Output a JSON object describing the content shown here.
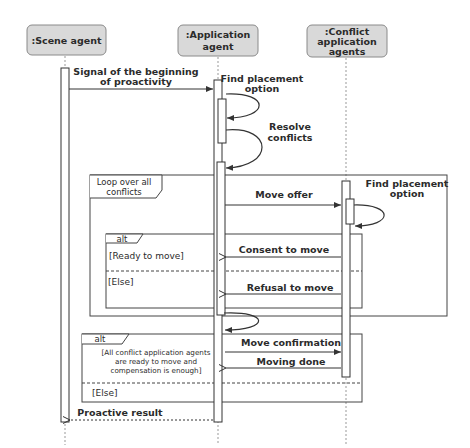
{
  "diagram": {
    "type": "UML sequence diagram",
    "colors": {
      "actor_fill": "#d9d9d9",
      "actor_stroke": "#8a8a8a",
      "line": "#333333",
      "lifeline": "#999999",
      "background": "#ffffff"
    },
    "lifelines": [
      {
        "id": "scene",
        "label": ":Scene agent"
      },
      {
        "id": "app",
        "label_lines": [
          ":Application",
          "agent"
        ]
      },
      {
        "id": "conflict",
        "label_lines": [
          ":Conflict",
          "application",
          "agents"
        ]
      }
    ],
    "messages": [
      {
        "from": "scene",
        "to": "app",
        "label_lines": [
          "Signal of the beginning",
          "of proactivity"
        ],
        "style": "sync"
      },
      {
        "from": "app",
        "to": "app",
        "label_lines": [
          "Find placement",
          "option"
        ],
        "style": "self"
      },
      {
        "from": "app",
        "to": "app",
        "label_lines": [
          "Resolve",
          "conflicts"
        ],
        "style": "self"
      },
      {
        "from": "app",
        "to": "conflict",
        "label": "Move offer",
        "style": "sync"
      },
      {
        "from": "conflict",
        "to": "conflict",
        "label_lines": [
          "Find placement",
          "option"
        ],
        "style": "self"
      },
      {
        "from": "conflict",
        "to": "app",
        "label": "Consent to move",
        "style": "reply"
      },
      {
        "from": "conflict",
        "to": "app",
        "label": "Refusal to move",
        "style": "reply"
      },
      {
        "from": "app",
        "to": "app",
        "label": "",
        "style": "self"
      },
      {
        "from": "app",
        "to": "conflict",
        "label": "Move confirmation",
        "style": "sync"
      },
      {
        "from": "conflict",
        "to": "app",
        "label": "Moving done",
        "style": "reply"
      },
      {
        "from": "app",
        "to": "scene",
        "label": "Proactive result",
        "style": "return-dashed"
      }
    ],
    "fragments": [
      {
        "kind": "loop",
        "label_lines": [
          "Loop over all",
          "conflicts"
        ]
      },
      {
        "kind": "alt",
        "label": "alt",
        "guards": [
          "[Ready to move]",
          "[Else]"
        ]
      },
      {
        "kind": "alt",
        "label": "alt",
        "guards_lines": [
          [
            "[All conflict application agents",
            "are ready to move and",
            "compensation is enough]"
          ],
          [
            "[Else]"
          ]
        ]
      }
    ]
  }
}
